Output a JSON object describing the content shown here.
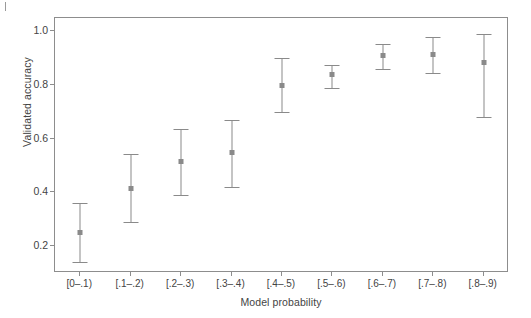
{
  "chart_data": {
    "type": "scatter",
    "title": "",
    "xlabel": "Model probability",
    "ylabel": "Validated accuracy",
    "grid": false,
    "legend": null,
    "ylim": [
      0.1,
      1.05
    ],
    "y_ticks": [
      "0.2",
      "0.4",
      "0.6",
      "0.8",
      "1.0"
    ],
    "y_tick_values": [
      0.2,
      0.4,
      0.6,
      0.8,
      1.0
    ],
    "categories": [
      "[0–.1)",
      "[.1–.2)",
      "[.2–.3)",
      "[.3–.4)",
      "[.4–.5)",
      "[.5–.6)",
      "[.6–.7)",
      "[.7–.8)",
      "[.8–.9)"
    ],
    "series": [
      {
        "name": "Validated accuracy",
        "values": [
          0.25,
          0.415,
          0.515,
          0.55,
          0.8,
          0.84,
          0.91,
          0.915,
          0.885
        ],
        "ci_low": [
          0.14,
          0.29,
          0.39,
          0.42,
          0.7,
          0.79,
          0.86,
          0.845,
          0.68
        ],
        "ci_high": [
          0.36,
          0.545,
          0.635,
          0.67,
          0.9,
          0.875,
          0.955,
          0.98,
          0.99
        ]
      }
    ]
  },
  "style": {
    "line_color": "#8a8a8a",
    "frame_color": "#8d8d8d",
    "text_color": "#444444",
    "background": "#ffffff"
  }
}
